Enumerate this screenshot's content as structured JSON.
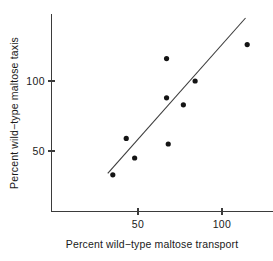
{
  "chart_data": {
    "type": "scatter",
    "title": "",
    "xlabel": "Percent wild−type maltose transport",
    "ylabel": "Percent wild−type maltose taxis",
    "xlim": [
      18,
      145
    ],
    "ylim": [
      8,
      149
    ],
    "xticks": [
      50,
      100
    ],
    "xtick_labels": [
      "50",
      "100"
    ],
    "yticks": [
      50,
      100
    ],
    "ytick_labels": [
      "50",
      "100"
    ],
    "grid": false,
    "legend": null,
    "marker": "filled-circle",
    "marker_color": "#141414",
    "line_color": "#3b3b3b",
    "axis_color": "#3b3b3b",
    "background": "#ffffff",
    "points": [
      {
        "x": 35,
        "y": 33
      },
      {
        "x": 43,
        "y": 59
      },
      {
        "x": 48,
        "y": 45
      },
      {
        "x": 67,
        "y": 88
      },
      {
        "x": 67,
        "y": 116
      },
      {
        "x": 68,
        "y": 55
      },
      {
        "x": 77,
        "y": 83
      },
      {
        "x": 84,
        "y": 100
      },
      {
        "x": 115,
        "y": 126
      }
    ],
    "fit_line": {
      "x": [
        32,
        114
      ],
      "y": [
        34,
        145
      ]
    }
  },
  "axes": {
    "x_tick_0": "50",
    "x_tick_1": "100",
    "y_tick_0": "50",
    "y_tick_1": "100",
    "x_title": "Percent wild−type maltose transport",
    "y_title": "Percent wild−type maltose taxis"
  }
}
